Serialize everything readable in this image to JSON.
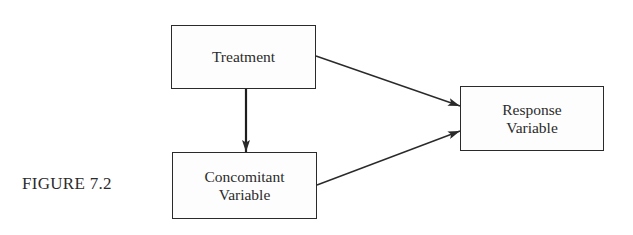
{
  "figure": {
    "label": "FIGURE 7.2"
  },
  "nodes": {
    "treatment": {
      "lines": [
        "Treatment"
      ]
    },
    "concomitant": {
      "lines": [
        "Concomitant",
        "Variable"
      ]
    },
    "response": {
      "lines": [
        "Response",
        "Variable"
      ]
    }
  },
  "edges": [
    {
      "from": "Treatment",
      "to": "Concomitant Variable"
    },
    {
      "from": "Treatment",
      "to": "Response Variable"
    },
    {
      "from": "Concomitant Variable",
      "to": "Response Variable"
    }
  ],
  "colors": {
    "stroke": "#2a2a2a",
    "text": "#2b2b2b",
    "background": "#ffffff"
  }
}
